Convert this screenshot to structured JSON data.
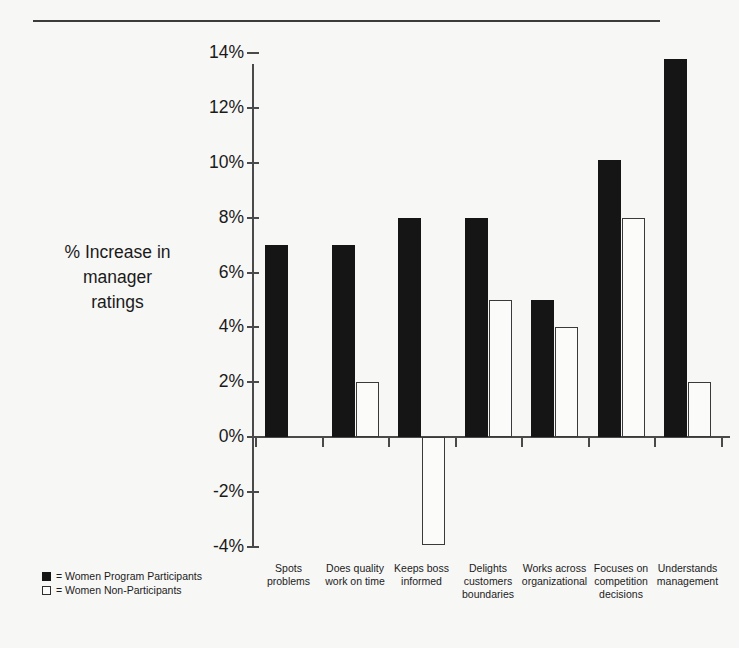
{
  "chart_data": {
    "type": "bar",
    "title": "",
    "xlabel": "",
    "ylabel": "% Increase in manager ratings",
    "ylim": [
      -4,
      14
    ],
    "ytick_labels": [
      "14%",
      "12%",
      "10%",
      "8%",
      "6%",
      "4%",
      "2%",
      "0%",
      "-2%",
      "-4%"
    ],
    "ytick_values": [
      14,
      12,
      10,
      8,
      6,
      4,
      2,
      0,
      -2,
      -4
    ],
    "grid": false,
    "legend_position": "bottom-left",
    "categories": [
      "Spots problems",
      "Does quality work on time",
      "Keeps boss informed",
      "Delights customers boundaries",
      "Works across organizational",
      "Focuses on competition decisions",
      "Understands management"
    ],
    "category_lines": [
      [
        "Spots",
        "problems"
      ],
      [
        "Does quality",
        "work on time"
      ],
      [
        "Keeps boss",
        "informed"
      ],
      [
        "Delights",
        "customers",
        "boundaries"
      ],
      [
        "Works across",
        "organizational"
      ],
      [
        "Focuses on",
        "competition",
        "decisions"
      ],
      [
        "Understands",
        "management"
      ]
    ],
    "series": [
      {
        "name": "Women Program Participants",
        "color": "#151515",
        "style": "filled",
        "values": [
          7,
          7,
          8,
          8,
          5,
          10.1,
          13.8
        ]
      },
      {
        "name": "Women Non-Participants",
        "color": "#ffffff",
        "style": "hollow",
        "values": [
          null,
          2,
          -3.95,
          5,
          4,
          8,
          2
        ]
      }
    ]
  },
  "legend": {
    "rows": [
      {
        "marker": "filled-square",
        "text": "= Women Program Participants"
      },
      {
        "marker": "hollow-square",
        "text": "= Women Non-Participants"
      }
    ]
  },
  "axis_title": {
    "lines": [
      "% Increase in",
      "manager",
      "ratings"
    ]
  }
}
